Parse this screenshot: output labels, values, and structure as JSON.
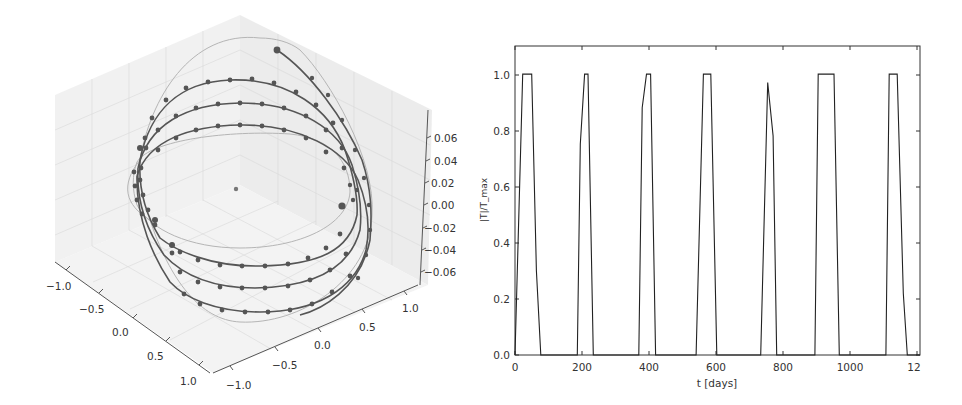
{
  "chart_data": [
    {
      "type": "scatter3d",
      "title": "",
      "description": "3D orbit trajectories with markers; light reference ellipses and central point",
      "xlabel": "",
      "ylabel": "",
      "zlabel": "",
      "x_ticks": [
        "−1.0",
        "−0.5",
        "0.0",
        "0.5",
        "1.0"
      ],
      "y_ticks": [
        "−1.0",
        "−0.5",
        "0.0",
        "0.5",
        "1.0"
      ],
      "z_ticks": [
        "0.06",
        "0.04",
        "0.02",
        "0.00",
        "−0.02",
        "−0.04",
        "−0.06"
      ],
      "xlim": [
        -1.0,
        1.0
      ],
      "ylim": [
        -1.0,
        1.0
      ],
      "zlim": [
        -0.07,
        0.07
      ],
      "grid": true,
      "series": [
        {
          "name": "orbit-1",
          "style": "dark line with circle markers"
        },
        {
          "name": "orbit-2",
          "style": "dark line with circle markers"
        },
        {
          "name": "orbit-3",
          "style": "dark line with circle markers"
        },
        {
          "name": "reference-ellipse-outer",
          "style": "thin light gray line"
        },
        {
          "name": "reference-ellipse-inner",
          "style": "thin light gray line"
        },
        {
          "name": "center",
          "style": "single gray dot",
          "x": 0,
          "y": 0,
          "z": 0
        }
      ]
    },
    {
      "type": "line",
      "title": "",
      "xlabel": "t [days]",
      "ylabel": "|T|/T_max",
      "xlim": [
        0,
        1210
      ],
      "ylim": [
        0,
        1.1
      ],
      "grid": false,
      "x_ticks": [
        "0",
        "200",
        "400",
        "600",
        "800",
        "1000",
        "12"
      ],
      "y_ticks": [
        "0.0",
        "0.2",
        "0.4",
        "0.6",
        "0.8",
        "1.0"
      ],
      "series": [
        {
          "name": "|T|/T_max",
          "x": [
            0,
            23,
            50,
            64,
            77,
            186,
            195,
            208,
            218,
            234,
            370,
            380,
            393,
            405,
            420,
            541,
            563,
            585,
            603,
            734,
            755,
            771,
            782,
            896,
            906,
            953,
            969,
            1108,
            1118,
            1142,
            1160,
            1172,
            1210
          ],
          "y": [
            0.0,
            1.0,
            1.0,
            0.3,
            0.0,
            0.0,
            0.75,
            1.0,
            1.0,
            0.0,
            0.0,
            0.88,
            1.0,
            1.0,
            0.0,
            0.0,
            1.0,
            1.0,
            0.0,
            0.0,
            0.97,
            0.78,
            0.0,
            0.0,
            1.0,
            1.0,
            0.0,
            0.0,
            1.0,
            1.0,
            0.22,
            0.0,
            0.0
          ]
        }
      ]
    }
  ],
  "left_panel": {
    "x_ticks": [
      "−1.0",
      "−0.5",
      "0.0",
      "0.5",
      "1.0"
    ],
    "y_ticks": [
      "−1.0",
      "−0.5",
      "0.0",
      "0.5",
      "1.0"
    ],
    "z_ticks": [
      "0.06",
      "0.04",
      "0.02",
      "0.00",
      "−0.02",
      "−0.04",
      "−0.06"
    ]
  },
  "right_panel": {
    "xlabel": "t [days]",
    "ylabel": "|T|/T_max",
    "x_ticks": [
      "0",
      "200",
      "400",
      "600",
      "800",
      "1000",
      "12"
    ],
    "y_ticks": [
      "0.0",
      "0.2",
      "0.4",
      "0.6",
      "0.8",
      "1.0"
    ]
  },
  "colors": {
    "trajectory": "#555555",
    "reference_line": "#b8b8b8",
    "pane": "#eeeeee",
    "grid": "#dddddd",
    "axis": "#444444",
    "series_line": "#222222"
  }
}
